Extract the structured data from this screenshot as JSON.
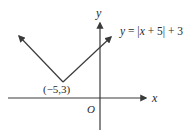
{
  "diagram": {
    "type": "graph-of-function",
    "equation": "y = |x + 5| + 3",
    "equation_parts": {
      "y": "y",
      "eq": " = ",
      "bar_open": "|",
      "x": "x",
      "inner": " + 5",
      "bar_close": "|",
      "tail": " + 3"
    },
    "vertex_label": "(−5,3)",
    "axes": {
      "x_label": "x",
      "y_label": "y",
      "origin_label": "O"
    },
    "colors": {
      "stroke": "#3a3a3a",
      "text": "#2a2a2a",
      "background": "#ffffff"
    }
  }
}
